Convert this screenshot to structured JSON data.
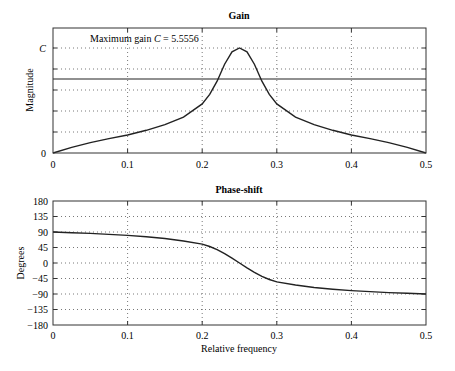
{
  "chart_data": [
    {
      "type": "line",
      "title": "Gain",
      "xlabel": "",
      "ylabel": "Magnitude",
      "xlim": [
        0,
        0.5
      ],
      "ylim": [
        0,
        5.5556
      ],
      "grid": true,
      "xticks": [
        "0",
        "0.1",
        "0.2",
        "0.3",
        "0.4",
        "0.5"
      ],
      "yticks": [
        "0",
        "C"
      ],
      "annotation": "Maximum gain C = 5.5556",
      "reference_line": {
        "y": 3.93,
        "label": "half-power level"
      },
      "x": [
        0,
        0.025,
        0.05,
        0.075,
        0.1,
        0.125,
        0.15,
        0.175,
        0.2,
        0.21,
        0.22,
        0.23,
        0.24,
        0.25,
        0.26,
        0.27,
        0.28,
        0.29,
        0.3,
        0.325,
        0.35,
        0.375,
        0.4,
        0.425,
        0.45,
        0.475,
        0.5
      ],
      "series": [
        {
          "name": "Gain",
          "values": [
            0,
            0.3,
            0.55,
            0.76,
            0.95,
            1.2,
            1.5,
            1.9,
            2.6,
            3.1,
            3.8,
            4.7,
            5.35,
            5.5556,
            5.35,
            4.7,
            3.8,
            3.1,
            2.6,
            1.9,
            1.5,
            1.2,
            0.95,
            0.76,
            0.55,
            0.3,
            0
          ]
        }
      ]
    },
    {
      "type": "line",
      "title": "Phase-shift",
      "xlabel": "Relative frequency",
      "ylabel": "Degrees",
      "xlim": [
        0,
        0.5
      ],
      "ylim": [
        -180,
        180
      ],
      "grid": true,
      "xticks": [
        "0",
        "0.1",
        "0.2",
        "0.3",
        "0.4",
        "0.5"
      ],
      "yticks": [
        "-180",
        "-135",
        "-90",
        "-45",
        "0",
        "45",
        "90",
        "135",
        "180"
      ],
      "x": [
        0,
        0.025,
        0.05,
        0.075,
        0.1,
        0.125,
        0.15,
        0.175,
        0.2,
        0.21,
        0.22,
        0.23,
        0.24,
        0.25,
        0.26,
        0.27,
        0.28,
        0.29,
        0.3,
        0.325,
        0.35,
        0.375,
        0.4,
        0.425,
        0.45,
        0.475,
        0.5
      ],
      "series": [
        {
          "name": "Phase",
          "values": [
            90,
            88,
            86,
            83,
            80,
            76,
            71,
            64,
            55,
            48,
            39,
            27,
            14,
            0,
            -14,
            -27,
            -39,
            -48,
            -55,
            -64,
            -71,
            -76,
            -80,
            -83,
            -86,
            -88,
            -90
          ]
        }
      ]
    }
  ],
  "gain": {
    "title": "Gain",
    "ylabel": "Magnitude",
    "annotation_prefix": "Maximum gain ",
    "annotation_var": "C",
    "annotation_suffix": " = 5.5556",
    "ytick_top": "C",
    "ytick_bottom": "0"
  },
  "phase": {
    "title": "Phase-shift",
    "ylabel": "Degrees",
    "xlabel": "Relative frequency"
  }
}
